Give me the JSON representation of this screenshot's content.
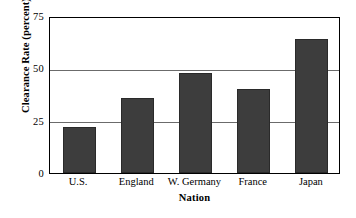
{
  "chart_data": {
    "type": "bar",
    "title": "",
    "categories": [
      "U.S.",
      "England",
      "W. Germany",
      "France",
      "Japan"
    ],
    "values": [
      22,
      36,
      48,
      40,
      64
    ],
    "xlabel": "Nation",
    "ylabel": "Clearance Rate (percent)",
    "ylim": [
      0,
      75
    ],
    "yticks": [
      "0",
      "25",
      "50",
      "75"
    ],
    "ytick_values": [
      0,
      25,
      50,
      75
    ],
    "grid": "horizontal",
    "legend": "none",
    "bar_color": "#3d3d3d",
    "gridline_color": "#6b6b6b",
    "frame_color": "#000000",
    "background_color": "#ffffff"
  },
  "axes": {
    "y_title": "Clearance Rate (percent)",
    "x_title": "Nation"
  }
}
